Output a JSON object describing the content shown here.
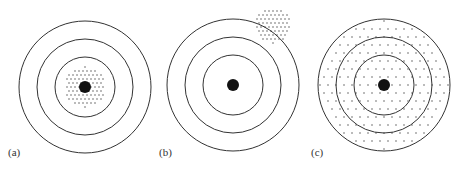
{
  "figure": {
    "panels": [
      {
        "id": "a",
        "label": "(a)",
        "cx": 85,
        "cy": 87,
        "cluster": "tight-center",
        "cluster_cx": 85,
        "cluster_cy": 87,
        "cluster_r": 20
      },
      {
        "id": "b",
        "label": "(b)",
        "cx": 233,
        "cy": 85,
        "cluster": "tight-offset",
        "cluster_cx": 273,
        "cluster_cy": 25,
        "cluster_r": 18
      },
      {
        "id": "c",
        "label": "(c)",
        "cx": 384,
        "cy": 85,
        "cluster": "scattered",
        "cluster_cx": 384,
        "cluster_cy": 85,
        "cluster_r": 64
      }
    ],
    "ring_radii": [
      66,
      48,
      30
    ],
    "bullseye_radius": 6,
    "colors": {
      "ring": "#333333",
      "dot": "#111111",
      "shot": "#444444"
    }
  }
}
